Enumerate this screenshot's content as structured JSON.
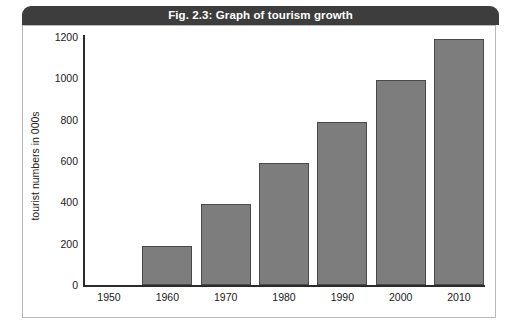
{
  "figure": {
    "title": "Fig. 2.3: Graph of tourism growth",
    "title_bar_color": "#3d3d3d",
    "title_text_color": "#ffffff",
    "frame_color": "#b9b9b9",
    "background": "#ffffff"
  },
  "chart_data": {
    "type": "bar",
    "title": "Fig. 2.3: Graph of tourism growth",
    "xlabel": "",
    "ylabel": "tourist numbers in 000s",
    "categories": [
      "1950",
      "1960",
      "1970",
      "1980",
      "1990",
      "2000",
      "2010"
    ],
    "values": [
      0,
      190,
      390,
      590,
      790,
      990,
      1190
    ],
    "ylim": [
      0,
      1200
    ],
    "yticks": [
      0,
      200,
      400,
      600,
      800,
      1000,
      1200
    ],
    "ytick_labels": [
      "0",
      "200",
      "400",
      "600",
      "800",
      "1000",
      "1200"
    ],
    "grid": false,
    "legend": false,
    "bar_color": "#7d7d7d",
    "bar_edge_color": "#4a4a4a",
    "axis_color": "#2b2b2b"
  }
}
